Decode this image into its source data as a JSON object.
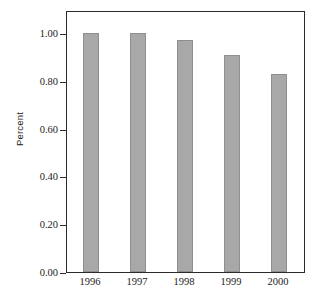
{
  "chart_data": {
    "type": "bar",
    "title": "",
    "subtitle": "",
    "xlabel": "",
    "ylabel": "Percent",
    "categories": [
      "1996",
      "1997",
      "1998",
      "1999",
      "2000"
    ],
    "values": [
      1.0,
      1.0,
      0.97,
      0.91,
      0.83
    ],
    "ylim": [
      0.0,
      1.0
    ],
    "ytick_labels": [
      "0.00",
      "0.20",
      "0.40",
      "0.60",
      "0.80",
      "1.00"
    ],
    "ytick_values": [
      0.0,
      0.2,
      0.4,
      0.6,
      0.8,
      1.0
    ],
    "grid": false,
    "legend": null,
    "legend_position": "none",
    "bar_color": "#a8a8a8",
    "bar_edge_color": "#8f8f8f",
    "frame_color": "#2b2b2b",
    "annotations": []
  }
}
